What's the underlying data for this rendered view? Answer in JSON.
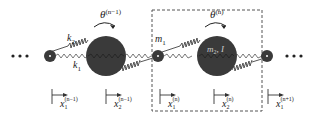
{
  "diagram": {
    "ellipsis_left": "• • •",
    "ellipsis_right": "• • •",
    "labels": {
      "k2": "k",
      "k2_sub": "2",
      "k1": "k",
      "k1_sub": "1",
      "m1": "m",
      "m1_sub": "1",
      "m2I": "m",
      "m2I_sub": "2",
      "m2I_tail": ", I",
      "theta_prev": "θ",
      "theta_prev_sup": "(n−1)",
      "theta_cur": "θ",
      "theta_cur_sup": "(n)"
    },
    "displacements": [
      {
        "base": "x",
        "sub": "1",
        "sup": "(n−1)"
      },
      {
        "base": "x",
        "sub": "2",
        "sup": "(n−1)"
      },
      {
        "base": "x",
        "sub": "1",
        "sup": "(n)"
      },
      {
        "base": "x",
        "sub": "2",
        "sup": "(n)"
      },
      {
        "base": "x",
        "sub": "1",
        "sup": "(n+1)"
      }
    ],
    "colors": {
      "mass": "#3a3a3a",
      "line": "#333333",
      "dash": "#555555"
    }
  }
}
